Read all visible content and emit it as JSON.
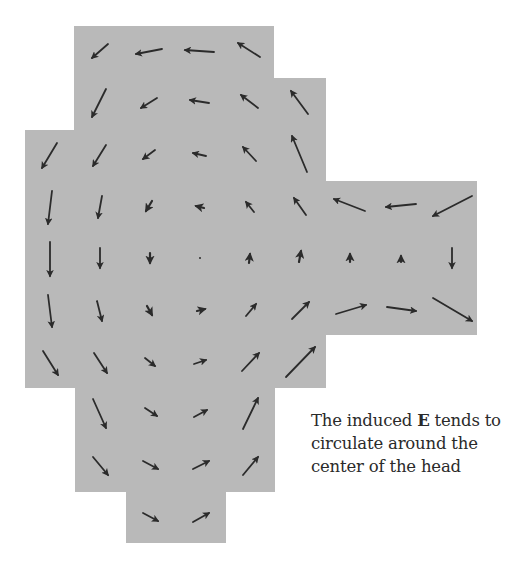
{
  "figure": {
    "background_color": "#b9b9b9",
    "arrow_color": "#2b2b2b",
    "head_region": [
      {
        "name": "top-block",
        "x": 74,
        "y": 26,
        "w": 200,
        "h": 110
      },
      {
        "name": "upper-right-step",
        "x": 274,
        "y": 78,
        "w": 52,
        "h": 110
      },
      {
        "name": "middle-block",
        "x": 25,
        "y": 130,
        "w": 301,
        "h": 258
      },
      {
        "name": "right-extension",
        "x": 325,
        "y": 181,
        "w": 152,
        "h": 154
      },
      {
        "name": "lower-block",
        "x": 75,
        "y": 387,
        "w": 200,
        "h": 105
      },
      {
        "name": "bottom-block",
        "x": 126,
        "y": 491,
        "w": 100,
        "h": 52
      }
    ],
    "arrows": [
      {
        "x1": 108,
        "y1": 44,
        "x2": 92,
        "y2": 58
      },
      {
        "x1": 162,
        "y1": 49,
        "x2": 136,
        "y2": 54
      },
      {
        "x1": 214,
        "y1": 52,
        "x2": 185,
        "y2": 50
      },
      {
        "x1": 260,
        "y1": 57,
        "x2": 238,
        "y2": 43
      },
      {
        "x1": 106,
        "y1": 89,
        "x2": 92,
        "y2": 117
      },
      {
        "x1": 157,
        "y1": 98,
        "x2": 141,
        "y2": 108
      },
      {
        "x1": 209,
        "y1": 103,
        "x2": 190,
        "y2": 100
      },
      {
        "x1": 258,
        "y1": 108,
        "x2": 241,
        "y2": 95
      },
      {
        "x1": 308,
        "y1": 114,
        "x2": 291,
        "y2": 91
      },
      {
        "x1": 57,
        "y1": 143,
        "x2": 42,
        "y2": 168
      },
      {
        "x1": 106,
        "y1": 145,
        "x2": 93,
        "y2": 166
      },
      {
        "x1": 155,
        "y1": 150,
        "x2": 143,
        "y2": 159
      },
      {
        "x1": 206,
        "y1": 156,
        "x2": 193,
        "y2": 153
      },
      {
        "x1": 256,
        "y1": 161,
        "x2": 243,
        "y2": 147
      },
      {
        "x1": 307,
        "y1": 172,
        "x2": 292,
        "y2": 136
      },
      {
        "x1": 52,
        "y1": 191,
        "x2": 48,
        "y2": 224
      },
      {
        "x1": 102,
        "y1": 196,
        "x2": 98,
        "y2": 218
      },
      {
        "x1": 152,
        "y1": 201,
        "x2": 146,
        "y2": 211
      },
      {
        "x1": 204,
        "y1": 208,
        "x2": 196,
        "y2": 206
      },
      {
        "x1": 254,
        "y1": 212,
        "x2": 246,
        "y2": 202
      },
      {
        "x1": 306,
        "y1": 215,
        "x2": 294,
        "y2": 198
      },
      {
        "x1": 365,
        "y1": 211,
        "x2": 334,
        "y2": 199
      },
      {
        "x1": 416,
        "y1": 204,
        "x2": 386,
        "y2": 207
      },
      {
        "x1": 472,
        "y1": 196,
        "x2": 433,
        "y2": 216
      },
      {
        "x1": 50,
        "y1": 242,
        "x2": 50,
        "y2": 276
      },
      {
        "x1": 100,
        "y1": 248,
        "x2": 100,
        "y2": 268
      },
      {
        "x1": 150,
        "y1": 253,
        "x2": 150,
        "y2": 263
      },
      {
        "x1": 200,
        "y1": 258,
        "x2": 200,
        "y2": 259
      },
      {
        "x1": 249,
        "y1": 263,
        "x2": 250,
        "y2": 254
      },
      {
        "x1": 299,
        "y1": 262,
        "x2": 301,
        "y2": 251
      },
      {
        "x1": 350,
        "y1": 262,
        "x2": 350,
        "y2": 254
      },
      {
        "x1": 401,
        "y1": 262,
        "x2": 401,
        "y2": 256
      },
      {
        "x1": 452,
        "y1": 248,
        "x2": 452,
        "y2": 268
      },
      {
        "x1": 48,
        "y1": 295,
        "x2": 52,
        "y2": 327
      },
      {
        "x1": 97,
        "y1": 301,
        "x2": 102,
        "y2": 321
      },
      {
        "x1": 147,
        "y1": 306,
        "x2": 152,
        "y2": 315
      },
      {
        "x1": 197,
        "y1": 311,
        "x2": 205,
        "y2": 309
      },
      {
        "x1": 246,
        "y1": 316,
        "x2": 256,
        "y2": 304
      },
      {
        "x1": 292,
        "y1": 319,
        "x2": 309,
        "y2": 302
      },
      {
        "x1": 336,
        "y1": 314,
        "x2": 366,
        "y2": 305
      },
      {
        "x1": 387,
        "y1": 307,
        "x2": 416,
        "y2": 311
      },
      {
        "x1": 433,
        "y1": 298,
        "x2": 472,
        "y2": 321
      },
      {
        "x1": 43,
        "y1": 351,
        "x2": 58,
        "y2": 375
      },
      {
        "x1": 94,
        "y1": 353,
        "x2": 107,
        "y2": 373
      },
      {
        "x1": 145,
        "y1": 358,
        "x2": 155,
        "y2": 366
      },
      {
        "x1": 194,
        "y1": 364,
        "x2": 206,
        "y2": 360
      },
      {
        "x1": 242,
        "y1": 371,
        "x2": 259,
        "y2": 353
      },
      {
        "x1": 286,
        "y1": 377,
        "x2": 315,
        "y2": 347
      },
      {
        "x1": 93,
        "y1": 399,
        "x2": 106,
        "y2": 428
      },
      {
        "x1": 145,
        "y1": 408,
        "x2": 157,
        "y2": 416
      },
      {
        "x1": 194,
        "y1": 417,
        "x2": 207,
        "y2": 410
      },
      {
        "x1": 243,
        "y1": 429,
        "x2": 258,
        "y2": 398
      },
      {
        "x1": 93,
        "y1": 457,
        "x2": 108,
        "y2": 475
      },
      {
        "x1": 143,
        "y1": 461,
        "x2": 158,
        "y2": 469
      },
      {
        "x1": 193,
        "y1": 469,
        "x2": 209,
        "y2": 461
      },
      {
        "x1": 243,
        "y1": 475,
        "x2": 258,
        "y2": 457
      },
      {
        "x1": 143,
        "y1": 513,
        "x2": 158,
        "y2": 521
      },
      {
        "x1": 193,
        "y1": 522,
        "x2": 209,
        "y2": 513
      }
    ]
  },
  "caption": {
    "before": "The induced ",
    "bold": "E",
    "after": " tends to circulate around the center of the head"
  }
}
